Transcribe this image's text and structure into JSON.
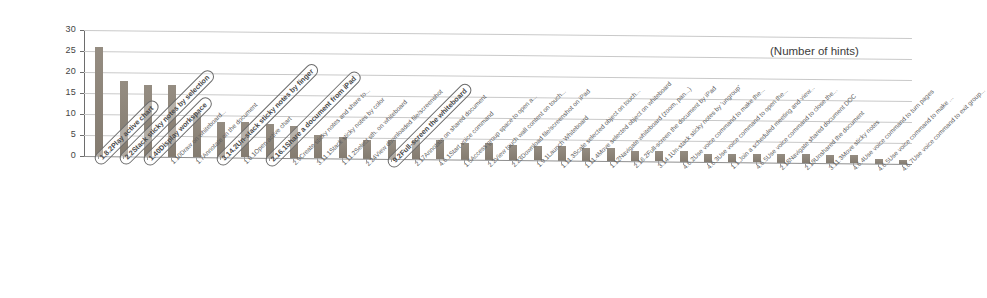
{
  "chart_data": {
    "type": "bar",
    "title": "",
    "annotation": "(Number of hints)",
    "xlabel": "",
    "ylabel": "",
    "ylim": [
      0,
      30
    ],
    "yticks": [
      0,
      5,
      10,
      15,
      20,
      25,
      30
    ],
    "grid": true,
    "legend": "none",
    "orientation": "vertical",
    "bar_color": "#8c8377",
    "categories": [
      "1.8.2Play active chart",
      "2.2Stack sticky notes by selection",
      "1.40Display workspace",
      "1.10Draw on whiteboard...",
      "1.7Annotate on the document",
      "3.14.2Un-stack sticky notes by finger",
      "1.8.1Open active chart",
      "2.16.1Share a document from iPad",
      "2.9Create sticky notes and share to...",
      "3.11.1Stack sticky notes by color",
      "1.11.2Select sth. on whiteboard",
      "2.24View downloaded file/screenshot",
      "9.2Full-screen the whiteboard",
      "2.17Annotate on shared document",
      "4.6.1Start voice command",
      "1.5Access group space to open a...",
      "2.2View touch wall content on touch...",
      "2.23Download file/screenshot on iPad",
      "1.9.1Launch Whiteboard",
      "1.11.3Scale selected object on touch...",
      "1.11.4Move selected object on whiteboard",
      "1.12Navigate whiteboard (zoom, pan...)",
      "2.16.2Full-screen the document by iPad",
      "3.14.1Un-stack sticky notes by 'ungroup'",
      "4.6.2Use voice command to make the...",
      "4.6.3Use voice command to open the...",
      "1.1 Join a scheduled meeting and view...",
      "4.6.5Use voice command to close the...",
      "2.18Navigate shared document DOC",
      "2.19Unshared the document",
      "3.11.3Move sticky notes",
      "4.6.4Use voice command to turn pages",
      "4.6.5Use voice command to make ...",
      "4.6.7Use voice command to exit group..."
    ],
    "values": [
      26,
      18,
      17,
      17,
      10.5,
      8.5,
      8.5,
      8,
      7.5,
      5.5,
      5,
      4.5,
      4.5,
      4.5,
      4.5,
      4,
      4,
      3.5,
      3.5,
      3.5,
      3,
      3,
      2.5,
      2.5,
      2.5,
      2,
      2,
      2,
      2,
      2,
      2,
      2,
      1,
      1
    ],
    "highlighted_categories": [
      "1.8.2Play active chart",
      "2.2Stack sticky notes by selection",
      "1.40Display workspace",
      "3.14.2Un-stack sticky notes by finger",
      "2.16.1Share a document from iPad",
      "9.2Full-screen the whiteboard"
    ]
  }
}
